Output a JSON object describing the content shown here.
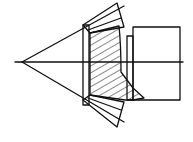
{
  "diagram": {
    "type": "bevel-gear-section",
    "colors": {
      "line": "#111111",
      "background": "#ffffff"
    },
    "apex": [
      22,
      62
    ],
    "axis": {
      "x1": 15,
      "x2": 183,
      "y": 62
    },
    "shaft": {
      "x": 133,
      "y": 27,
      "w": 47,
      "h": 73
    }
  }
}
